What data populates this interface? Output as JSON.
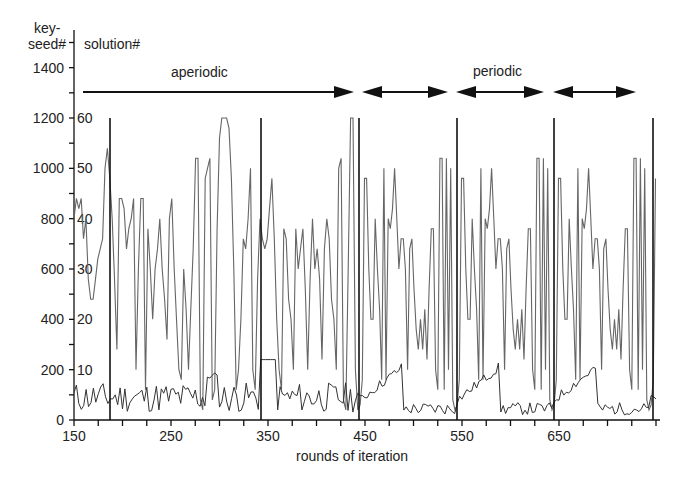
{
  "chart_data": {
    "type": "line",
    "title": "",
    "xlabel": "rounds of iteration",
    "ylabel_left": "key-seed#",
    "ylabel_left_line1": "key-",
    "ylabel_left_line2": "seed#",
    "ylabel_right": "solution#",
    "xlim": [
      150,
      750
    ],
    "ylim_left": [
      0,
      1400
    ],
    "ylim_right": [
      0,
      60
    ],
    "x_ticks": [
      150,
      250,
      350,
      450,
      550,
      650
    ],
    "y_ticks_left": [
      0,
      200,
      400,
      600,
      800,
      1000,
      1200,
      1400
    ],
    "y_ticks_right": [
      10,
      20,
      30,
      40,
      50,
      60
    ],
    "grid": false,
    "legend": null,
    "annotations": [
      {
        "text": "aperiodic",
        "x_start": 157,
        "x_end": 436,
        "type": "single-arrow"
      },
      {
        "text": "periodic",
        "segments": [
          [
            446,
            534
          ],
          [
            543,
            633
          ],
          [
            643,
            728
          ]
        ],
        "type": "double-arrow"
      }
    ],
    "series": [
      {
        "name": "key-seed#",
        "axis": "left",
        "description": "spikes to 1200 at roughly periodic positions",
        "spike_x": [
          186,
          341,
          444,
          545,
          645,
          745
        ],
        "spike_value": 1200,
        "baseline_range": [
          0,
          220
        ]
      },
      {
        "name": "solution#",
        "axis": "right",
        "description": "oscillating between ~2 and 60; aperiodic before ~445, periodic with period ~100 rounds afterwards",
        "value_range": [
          2,
          60
        ]
      }
    ]
  },
  "annotations_text": {
    "aperiodic": "aperiodic",
    "periodic": "periodic"
  },
  "axis_labels": {
    "x": "rounds of iteration",
    "left_1": "key-",
    "left_2": "seed#",
    "right": "solution#"
  },
  "ticks": {
    "x": [
      "150",
      "250",
      "350",
      "450",
      "550",
      "650"
    ],
    "left": [
      "0",
      "200",
      "400",
      "600",
      "800",
      "1000",
      "1200",
      "1400"
    ],
    "right": [
      "10",
      "20",
      "30",
      "40",
      "50",
      "60"
    ]
  }
}
